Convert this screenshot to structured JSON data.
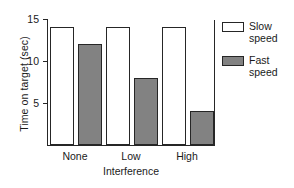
{
  "chart_data": {
    "type": "bar",
    "title": "",
    "categories": [
      "None",
      "Low",
      "High"
    ],
    "series": [
      {
        "name": "Slow speed",
        "values": [
          14,
          14,
          14
        ],
        "color": "#ffffff",
        "edge_color": "#262626"
      },
      {
        "name": "Fast speed",
        "values": [
          12,
          8,
          4
        ],
        "color": "#828282",
        "edge_color": "#262626"
      }
    ],
    "xlabel": "Interference",
    "ylabel": "Time on target (sec)",
    "ylim": [
      0,
      15
    ],
    "yticks": [
      5,
      10,
      15
    ],
    "ytick_labels": [
      "5",
      "10",
      "15"
    ],
    "grid": false,
    "legend_position": "right-outside"
  },
  "axes": {
    "y_title": "Time on target (sec)",
    "x_title": "Interference",
    "y_ticks": [
      {
        "value": 15,
        "label": "15"
      },
      {
        "value": 10,
        "label": "10"
      },
      {
        "value": 5,
        "label": "5"
      }
    ],
    "x_ticks": [
      {
        "label": "None"
      },
      {
        "label": "Low"
      },
      {
        "label": "High"
      }
    ]
  },
  "legend": {
    "items": [
      {
        "label": "Slow\nspeed",
        "swatch": "slow"
      },
      {
        "label": "Fast\nspeed",
        "swatch": "fast"
      }
    ]
  }
}
